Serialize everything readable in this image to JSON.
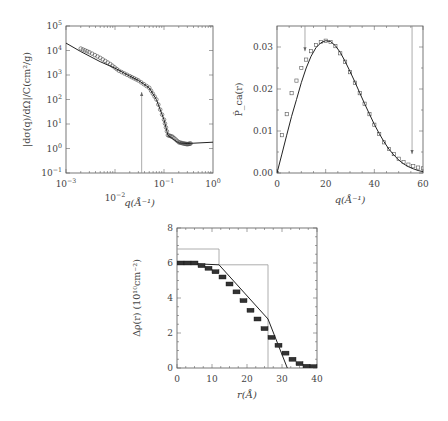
{
  "chart_data": [
    {
      "type": "scatter",
      "title": "",
      "xlabel": "q(Å⁻¹)",
      "ylabel": "|dσ(q)/dΩ|/C(cm²/g)",
      "xscale": "log",
      "yscale": "log",
      "xlim": [
        0.001,
        1
      ],
      "ylim": [
        0.1,
        100000
      ],
      "x_tick_labels": [
        "10⁻³",
        "10⁻²",
        "10⁻¹",
        "10⁰"
      ],
      "y_tick_labels": [
        "10⁻¹",
        "10⁰",
        "10¹",
        "10²",
        "10³",
        "10⁴",
        "10⁵"
      ],
      "annotations": [
        {
          "type": "arrow-up",
          "x": 0.035,
          "y_from": 0.1,
          "y_to": 200
        }
      ],
      "series": [
        {
          "name": "data (circles)",
          "style": "markers",
          "x": [
            0.002,
            0.003,
            0.005,
            0.008,
            0.012,
            0.02,
            0.03,
            0.05,
            0.07,
            0.1,
            0.12,
            0.15,
            0.2,
            0.25,
            0.3,
            0.35
          ],
          "y": [
            12000,
            8500,
            5000,
            2800,
            1500,
            900,
            600,
            300,
            100,
            15,
            3.5,
            3,
            1.8,
            1.6,
            1.5,
            1.6
          ]
        },
        {
          "name": "fit (line)",
          "style": "line",
          "x": [
            0.001,
            0.002,
            0.005,
            0.01,
            0.02,
            0.03,
            0.05,
            0.07,
            0.1,
            0.12,
            0.15,
            0.2,
            0.3,
            1.0
          ],
          "y": [
            20000,
            9000,
            3500,
            1900,
            900,
            600,
            300,
            100,
            15,
            3.5,
            2.5,
            1.7,
            1.6,
            1.8
          ]
        }
      ]
    },
    {
      "type": "scatter",
      "title": "",
      "xlabel": "q(Å⁻¹)",
      "ylabel": "P̂_ca(r)",
      "xlim": [
        0,
        60
      ],
      "ylim": [
        0,
        0.035
      ],
      "x_tick_labels": [
        "0",
        "20",
        "40",
        "60"
      ],
      "y_tick_labels": [
        "0.00",
        "0.01",
        "0.02",
        "0.03"
      ],
      "annotations": [
        {
          "type": "arrow-down",
          "x": 11.5,
          "y_from": 0.035,
          "y_to": 0.029
        },
        {
          "type": "arrow-down",
          "x": 55.5,
          "y_from": 0.035,
          "y_to": 0.0045
        }
      ],
      "series": [
        {
          "name": "data (squares)",
          "style": "markers",
          "x": [
            0,
            2,
            4,
            6,
            8,
            10,
            12,
            14,
            16,
            18,
            20,
            22,
            24,
            26,
            28,
            30,
            32,
            34,
            36,
            38,
            40,
            42,
            44,
            46,
            48,
            50,
            52,
            54,
            56,
            58,
            60
          ],
          "y": [
            0.0,
            0.009,
            0.014,
            0.019,
            0.022,
            0.025,
            0.027,
            0.029,
            0.0305,
            0.0312,
            0.0315,
            0.0312,
            0.0302,
            0.0285,
            0.0265,
            0.024,
            0.0215,
            0.019,
            0.0165,
            0.014,
            0.0115,
            0.0093,
            0.0073,
            0.0057,
            0.0045,
            0.0034,
            0.0026,
            0.002,
            0.0016,
            0.0013,
            0.0011
          ]
        },
        {
          "name": "fit (line)",
          "style": "line",
          "x": [
            0,
            2,
            4,
            6,
            8,
            10,
            12,
            14,
            16,
            18,
            20,
            22,
            24,
            26,
            28,
            30,
            32,
            34,
            36,
            38,
            40,
            42,
            44,
            46,
            48,
            50,
            52,
            54,
            56,
            58,
            60
          ],
          "y": [
            0.0,
            0.0045,
            0.009,
            0.0135,
            0.0175,
            0.0215,
            0.025,
            0.0278,
            0.0298,
            0.031,
            0.0315,
            0.0313,
            0.0303,
            0.0287,
            0.0266,
            0.0242,
            0.0217,
            0.0191,
            0.0165,
            0.014,
            0.0116,
            0.0094,
            0.0074,
            0.0057,
            0.0043,
            0.0031,
            0.0022,
            0.0015,
            0.001,
            0.0006,
            0.0003
          ]
        }
      ]
    },
    {
      "type": "line",
      "title": "",
      "xlabel": "r(Å)",
      "ylabel": "Δρ(r) (10¹⁰cm⁻²)",
      "xlim": [
        0,
        40
      ],
      "ylim": [
        0,
        8
      ],
      "x_tick_labels": [
        "0",
        "10",
        "20",
        "30",
        "40"
      ],
      "y_tick_labels": [
        "0",
        "2",
        "4",
        "6",
        "8"
      ],
      "series": [
        {
          "name": "step profile (gray)",
          "style": "line",
          "x": [
            0,
            12,
            12,
            26,
            26
          ],
          "y": [
            6.8,
            6.8,
            5.9,
            5.9,
            0
          ]
        },
        {
          "name": "linear profile (black)",
          "style": "line",
          "x": [
            0,
            12,
            26,
            31.5
          ],
          "y": [
            6.0,
            5.9,
            2.8,
            0
          ]
        },
        {
          "name": "histogram bins (data)",
          "style": "markers",
          "x": [
            1,
            3,
            5,
            7,
            9,
            11,
            13,
            15,
            17,
            19,
            21,
            23,
            25,
            27,
            29,
            31,
            33,
            35,
            37,
            39
          ],
          "y": [
            6.0,
            6.0,
            6.0,
            5.85,
            5.7,
            5.5,
            5.2,
            4.8,
            4.35,
            3.85,
            3.3,
            2.8,
            2.25,
            1.75,
            1.3,
            0.85,
            0.5,
            0.25,
            0.1,
            0.08
          ]
        }
      ]
    }
  ],
  "panels": {
    "p1": {
      "xlabel": "q(Å⁻¹)",
      "ylabel": "|dσ(q)/dΩ|/C(cm²/g)"
    },
    "p2": {
      "xlabel": "q(Å⁻¹)",
      "ylabel": "P̂ca(r)"
    },
    "p3": {
      "xlabel": "r(Å)",
      "ylabel": "Δρ(r) (10¹⁰cm⁻²)"
    }
  }
}
